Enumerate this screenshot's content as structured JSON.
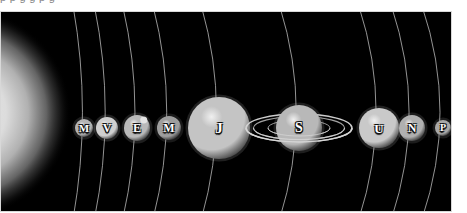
{
  "page": {
    "background_color": "#ffffff",
    "clipped_caption_text": "p p g g p g"
  },
  "figure": {
    "panel_background_color": "#000000",
    "border_color": "#d8d8d8",
    "orbit_line_color": "#c8c8c8",
    "label_text_color": "#ffffff",
    "label_outline_color": "#121212"
  },
  "sun": {
    "name": "sun-glow",
    "label": "",
    "center_x": -42,
    "center_y": 101,
    "radius": 112,
    "core_color": "#e8e8e8",
    "edge_color": "#000000"
  },
  "orbits": [
    {
      "name": "orbit-mercury",
      "x": 83,
      "bulge": 26
    },
    {
      "name": "orbit-venus",
      "x": 106,
      "bulge": 30
    },
    {
      "name": "orbit-earth",
      "x": 136,
      "bulge": 34
    },
    {
      "name": "orbit-mars",
      "x": 168,
      "bulge": 38
    },
    {
      "name": "orbit-jupiter",
      "x": 218,
      "bulge": 42
    },
    {
      "name": "orbit-saturn",
      "x": 298,
      "bulge": 46
    },
    {
      "name": "orbit-uranus",
      "x": 378,
      "bulge": 48
    },
    {
      "name": "orbit-neptune",
      "x": 411,
      "bulge": 49
    },
    {
      "name": "orbit-pluto",
      "x": 442,
      "bulge": 50
    }
  ],
  "planets": [
    {
      "id": "mercury",
      "label": "M",
      "center_x": 83,
      "center_y": 116,
      "radius": 9,
      "font_size": 11,
      "body_color": "#b4b4b4",
      "shadow_color": "#3a3a3a",
      "has_rings": false,
      "has_moon": false
    },
    {
      "id": "venus",
      "label": "V",
      "center_x": 106,
      "center_y": 116,
      "radius": 11,
      "font_size": 12,
      "body_color": "#cfcfcf",
      "shadow_color": "#484848",
      "has_rings": false,
      "has_moon": false
    },
    {
      "id": "earth",
      "label": "E",
      "center_x": 136,
      "center_y": 116,
      "radius": 13,
      "font_size": 12,
      "body_color": "#b9b9b9",
      "shadow_color": "#3d3d3d",
      "has_rings": false,
      "has_moon": true
    },
    {
      "id": "mars",
      "label": "M",
      "center_x": 168,
      "center_y": 116,
      "radius": 12,
      "font_size": 12,
      "body_color": "#9e9e9e",
      "shadow_color": "#2e2e2e",
      "has_rings": false,
      "has_moon": false
    },
    {
      "id": "jupiter",
      "label": "J",
      "center_x": 218,
      "center_y": 116,
      "radius": 31,
      "font_size": 15,
      "body_color": "#c4c4c4",
      "shadow_color": "#4a4a4a",
      "has_rings": false,
      "has_moon": false
    },
    {
      "id": "saturn",
      "label": "S",
      "center_x": 298,
      "center_y": 116,
      "radius": 23,
      "font_size": 14,
      "body_color": "#b8b8b8",
      "shadow_color": "#414141",
      "has_rings": true,
      "ring_outer_rx": 53,
      "ring_outer_ry": 14,
      "ring_inner_rx": 31,
      "ring_inner_ry": 8,
      "ring_color": "#d6d6d6",
      "has_moon": false
    },
    {
      "id": "uranus",
      "label": "U",
      "center_x": 378,
      "center_y": 116,
      "radius": 20,
      "font_size": 13,
      "body_color": "#c9c9c9",
      "shadow_color": "#474747",
      "has_rings": false,
      "has_moon": false
    },
    {
      "id": "neptune",
      "label": "N",
      "center_x": 411,
      "center_y": 116,
      "radius": 13,
      "font_size": 12,
      "body_color": "#b0b0b0",
      "shadow_color": "#383838",
      "has_rings": false,
      "has_moon": false
    },
    {
      "id": "pluto",
      "label": "P",
      "center_x": 442,
      "center_y": 116,
      "radius": 8,
      "font_size": 10,
      "body_color": "#a8a8a8",
      "shadow_color": "#303030",
      "has_rings": false,
      "has_moon": false
    }
  ]
}
